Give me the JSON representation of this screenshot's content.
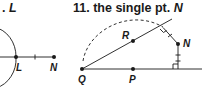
{
  "left_figure": {
    "title_var": "L",
    "points": [
      {
        "name": "L",
        "x": 16,
        "y": 57
      },
      {
        "name": "N",
        "x": 54,
        "y": 57
      }
    ]
  },
  "right_figure": {
    "title_number": "11.",
    "title_text": "the single pt.",
    "title_var": "N",
    "points": [
      {
        "name": "Q",
        "x": 82,
        "y": 69
      },
      {
        "name": "R",
        "x": 133,
        "y": 41
      },
      {
        "name": "P",
        "x": 133,
        "y": 69
      },
      {
        "name": "N",
        "x": 178,
        "y": 44
      }
    ]
  },
  "colors": {
    "ink": "#1a1a1a",
    "background": "#ffffff"
  }
}
